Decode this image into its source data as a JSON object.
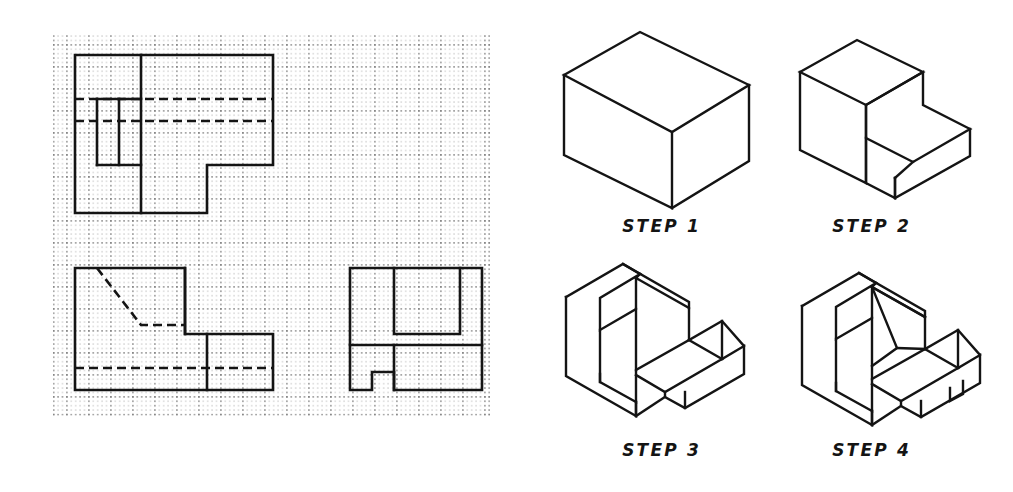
{
  "sheet": {
    "title": "Isometric Construction Steps Worksheet",
    "background_color": "#ffffff",
    "line_color": "#141414",
    "grid_dot_color": "#5a5a5a"
  },
  "grid": {
    "name": "dotted-isometric-worksheet-grid",
    "x": 53,
    "y": 33,
    "width": 437,
    "height": 383,
    "minor_spacing_px": 4.4,
    "major_spacing_px": 22,
    "dot_radius_px": 0.75,
    "columns": 20,
    "rows": 18
  },
  "orthographic_views": [
    {
      "name": "top-view",
      "label": "",
      "outline": "L-shaped plan with inner rectangle detail and two long horizontal hidden lines",
      "origin": {
        "x": 75,
        "y": 55
      },
      "cells_wide": 19,
      "cells_tall": 8
    },
    {
      "name": "front-view",
      "label": "",
      "outline": "Stepped elevation with inclined hidden line and lower horizontal hidden line",
      "origin": {
        "x": 75,
        "y": 268
      },
      "cells_wide": 19,
      "cells_tall": 6
    },
    {
      "name": "right-side-view",
      "label": "",
      "outline": "Rectangle with top slot recess, horizontal division and bottom notch",
      "origin": {
        "x": 350,
        "y": 268
      },
      "cells_wide": 8,
      "cells_tall": 6
    }
  ],
  "steps": [
    {
      "id": "step-1",
      "label": "STEP",
      "number": "1",
      "caption": "STEP 1",
      "description": "Block out the overall rectangular prism in isometric."
    },
    {
      "id": "step-2",
      "label": "STEP",
      "number": "2",
      "caption": "STEP 2",
      "description": "Remove the large lower-right step to create the L profile."
    },
    {
      "id": "step-3",
      "label": "STEP",
      "number": "3",
      "caption": "STEP 3",
      "description": "Cut the vertical slot through the upright portion and the base step."
    },
    {
      "id": "step-4",
      "label": "STEP",
      "number": "4",
      "caption": "STEP 4",
      "description": "Add the inclined surface inside the slot and the small notch in the base."
    }
  ],
  "colors": {
    "ink": "#141414",
    "dots": "#5a5a5a",
    "paper": "#ffffff"
  }
}
